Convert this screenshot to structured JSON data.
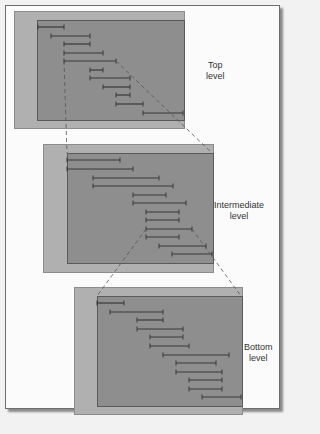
{
  "diagram": {
    "levels": [
      {
        "label_line1": "Top",
        "label_line2": "level",
        "outer": {
          "x": 14,
          "y": 11,
          "w": 169,
          "h": 116
        },
        "inner": {
          "x": 37,
          "y": 20,
          "w": 146,
          "h": 99
        },
        "label_pos": {
          "x": 206,
          "y": 60
        },
        "bars": [
          {
            "x1": 38,
            "x2": 64,
            "y": 27
          },
          {
            "x1": 51,
            "x2": 90,
            "y": 36
          },
          {
            "x1": 64,
            "x2": 90,
            "y": 44
          },
          {
            "x1": 64,
            "x2": 103,
            "y": 53
          },
          {
            "x1": 64,
            "x2": 116,
            "y": 61
          },
          {
            "x1": 90,
            "x2": 103,
            "y": 70
          },
          {
            "x1": 90,
            "x2": 130,
            "y": 78
          },
          {
            "x1": 103,
            "x2": 130,
            "y": 87
          },
          {
            "x1": 116,
            "x2": 130,
            "y": 95
          },
          {
            "x1": 116,
            "x2": 143,
            "y": 104
          },
          {
            "x1": 143,
            "x2": 183,
            "y": 113
          }
        ]
      },
      {
        "label_line1": "Intermediate",
        "label_line2": "level",
        "outer": {
          "x": 43,
          "y": 144,
          "w": 169,
          "h": 127
        },
        "inner": {
          "x": 67,
          "y": 153,
          "w": 145,
          "h": 109
        },
        "label_pos": {
          "x": 214,
          "y": 200
        },
        "bars": [
          {
            "x1": 67,
            "x2": 120,
            "y": 160
          },
          {
            "x1": 67,
            "x2": 133,
            "y": 169
          },
          {
            "x1": 93,
            "x2": 159,
            "y": 178
          },
          {
            "x1": 93,
            "x2": 173,
            "y": 186
          },
          {
            "x1": 133,
            "x2": 166,
            "y": 195
          },
          {
            "x1": 133,
            "x2": 186,
            "y": 203
          },
          {
            "x1": 146,
            "x2": 179,
            "y": 212
          },
          {
            "x1": 146,
            "x2": 179,
            "y": 220
          },
          {
            "x1": 146,
            "x2": 192,
            "y": 229
          },
          {
            "x1": 146,
            "x2": 179,
            "y": 237
          },
          {
            "x1": 159,
            "x2": 206,
            "y": 246
          },
          {
            "x1": 172,
            "x2": 212,
            "y": 254
          }
        ]
      },
      {
        "label_line1": "Bottom",
        "label_line2": "level",
        "outer": {
          "x": 74,
          "y": 287,
          "w": 167,
          "h": 126
        },
        "inner": {
          "x": 97,
          "y": 296,
          "w": 144,
          "h": 109
        },
        "label_pos": {
          "x": 244,
          "y": 342
        },
        "bars": [
          {
            "x1": 97,
            "x2": 124,
            "y": 303
          },
          {
            "x1": 110,
            "x2": 163,
            "y": 312
          },
          {
            "x1": 137,
            "x2": 163,
            "y": 320
          },
          {
            "x1": 137,
            "x2": 183,
            "y": 329
          },
          {
            "x1": 150,
            "x2": 183,
            "y": 337
          },
          {
            "x1": 150,
            "x2": 189,
            "y": 346
          },
          {
            "x1": 163,
            "x2": 229,
            "y": 355
          },
          {
            "x1": 176,
            "x2": 216,
            "y": 363
          },
          {
            "x1": 176,
            "x2": 222,
            "y": 372
          },
          {
            "x1": 189,
            "x2": 222,
            "y": 380
          },
          {
            "x1": 189,
            "x2": 222,
            "y": 389
          },
          {
            "x1": 202,
            "x2": 241,
            "y": 397
          }
        ]
      }
    ],
    "connectors": [
      {
        "x1": 64,
        "y1": 61,
        "x2": 67,
        "y2": 153
      },
      {
        "x1": 116,
        "y1": 61,
        "x2": 212,
        "y2": 153
      },
      {
        "x1": 146,
        "y1": 229,
        "x2": 97,
        "y2": 296
      },
      {
        "x1": 192,
        "y1": 229,
        "x2": 241,
        "y2": 296
      }
    ],
    "colors": {
      "frame_bg": "#fbfbfb",
      "outer_panel": "#b0b0b0",
      "inner_panel": "#8e8e8e",
      "bar": "#383838",
      "connector": "#555555"
    }
  }
}
